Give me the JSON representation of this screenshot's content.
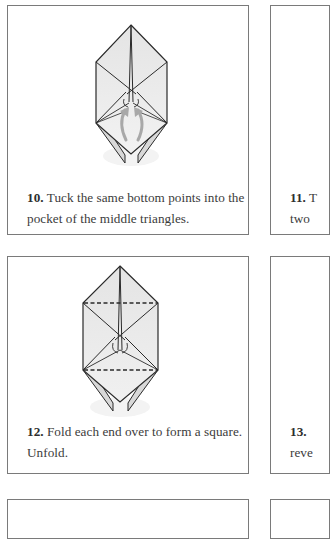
{
  "page": {
    "type": "origami instruction steps"
  },
  "steps": [
    {
      "number": "10.",
      "text_line1": " Tuck the same bottom points into the",
      "text_line2": "pocket of the middle triangles.",
      "diagram": "folded-model-with-tuck-arrows-icon"
    },
    {
      "number": "11.",
      "text_line1": " T",
      "text_line2": "two",
      "diagram": ""
    },
    {
      "number": "12.",
      "text_line1": " Fold each end over to form a square.",
      "text_line2": "Unfold.",
      "diagram": "folded-model-with-dashed-fold-lines-icon"
    },
    {
      "number": "13.",
      "text_line1": " ",
      "text_line2": "reve",
      "diagram": ""
    }
  ],
  "colors": {
    "card_border": "#7a7a7a",
    "paper_fill": "#e6e6e6",
    "line": "#2a2a2a",
    "arrow": "#a8a8a8",
    "text": "#3b3b3b"
  }
}
